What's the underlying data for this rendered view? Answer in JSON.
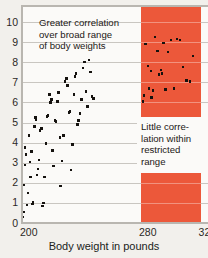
{
  "chart_data": {
    "type": "scatter",
    "title": "",
    "xlabel": "Body weight in pounds",
    "ylabel": "",
    "xlim": [
      200,
      325
    ],
    "ylim": [
      0,
      10.8
    ],
    "grid": true,
    "legend": false,
    "xticks": [
      {
        "value": 200,
        "label": "200"
      },
      {
        "value": 280,
        "label": "280"
      },
      {
        "value": 320,
        "label": "320"
      }
    ],
    "yticks": [
      {
        "value": 0,
        "label": "0"
      },
      {
        "value": 1,
        "label": "1"
      },
      {
        "value": 2,
        "label": "2"
      },
      {
        "value": 3,
        "label": "3"
      },
      {
        "value": 4,
        "label": "4"
      },
      {
        "value": 5,
        "label": "5"
      },
      {
        "value": 6,
        "label": "6"
      },
      {
        "value": 7,
        "label": "7"
      },
      {
        "value": 8,
        "label": "8"
      },
      {
        "value": 9,
        "label": "9"
      },
      {
        "value": 10,
        "label": "10"
      }
    ],
    "highlight_band": {
      "x_start": 280,
      "x_end": 320,
      "color": "#ec583a",
      "label": "restricted range"
    },
    "annotations": [
      {
        "name": "broad-range-note",
        "text": "Greater correlation over broad range of body weights",
        "lines": [
          "Greater correlation",
          "over broad range",
          "of body weights"
        ]
      },
      {
        "name": "restricted-range-note",
        "text": "Little correlation within restricted range",
        "lines": [
          "Little corre-",
          "lation within",
          "restricted",
          "range"
        ]
      }
    ],
    "series": [
      {
        "name": "broad-range-points",
        "color": "#15120f",
        "points": [
          [
            200.6,
            0.3
          ],
          [
            201.4,
            0.55
          ],
          [
            201.0,
            1.9
          ],
          [
            202.2,
            2.9
          ],
          [
            202.6,
            3.4
          ],
          [
            202.0,
            3.75
          ],
          [
            203.2,
            0.9
          ],
          [
            204.0,
            1.5
          ],
          [
            204.6,
            4.35
          ],
          [
            205.2,
            3.05
          ],
          [
            205.8,
            2.3
          ],
          [
            206.4,
            3.55
          ],
          [
            207.0,
            0.95
          ],
          [
            207.6,
            1.05
          ],
          [
            208.4,
            4.8
          ],
          [
            209.0,
            5.25
          ],
          [
            209.6,
            5.15
          ],
          [
            210.2,
            2.4
          ],
          [
            210.8,
            2.7
          ],
          [
            211.6,
            3.15
          ],
          [
            212.2,
            4.6
          ],
          [
            213.0,
            4.7
          ],
          [
            213.8,
            0.85
          ],
          [
            214.4,
            1.0
          ],
          [
            215.2,
            2.3
          ],
          [
            216.0,
            3.95
          ],
          [
            216.8,
            5.3
          ],
          [
            217.6,
            5.35
          ],
          [
            218.6,
            6.4
          ],
          [
            219.2,
            6.0
          ],
          [
            219.8,
            6.15
          ],
          [
            220.4,
            3.6
          ],
          [
            221.2,
            2.85
          ],
          [
            222.0,
            5.1
          ],
          [
            223.0,
            5.05
          ],
          [
            223.8,
            6.05
          ],
          [
            224.6,
            6.5
          ],
          [
            225.4,
            4.25
          ],
          [
            226.0,
            1.85
          ],
          [
            227.0,
            3.1
          ],
          [
            228.0,
            4.35
          ],
          [
            229.0,
            7.05
          ],
          [
            229.8,
            7.2
          ],
          [
            230.6,
            6.85
          ],
          [
            231.4,
            5.5
          ],
          [
            232.2,
            5.55
          ],
          [
            233.0,
            2.65
          ],
          [
            234.0,
            3.9
          ],
          [
            234.8,
            6.4
          ],
          [
            235.6,
            7.3
          ],
          [
            236.4,
            7.45
          ],
          [
            237.2,
            4.9
          ],
          [
            238.0,
            5.1
          ],
          [
            239.0,
            5.45
          ],
          [
            240.0,
            6.15
          ],
          [
            241.0,
            7.7
          ],
          [
            242.0,
            8.0
          ],
          [
            243.0,
            6.55
          ],
          [
            244.0,
            5.8
          ],
          [
            245.0,
            8.1
          ],
          [
            246.0,
            7.5
          ],
          [
            247.0,
            6.3
          ],
          [
            248.0,
            6.2
          ]
        ]
      },
      {
        "name": "restricted-range-points",
        "color": "#15120f",
        "points": [
          [
            281.5,
            6.05
          ],
          [
            282.0,
            6.35
          ],
          [
            283.0,
            8.9
          ],
          [
            284.5,
            7.8
          ],
          [
            285.5,
            6.7
          ],
          [
            286.5,
            7.55
          ],
          [
            288.0,
            6.6
          ],
          [
            289.5,
            9.25
          ],
          [
            291.0,
            8.55
          ],
          [
            292.0,
            7.4
          ],
          [
            293.5,
            7.6
          ],
          [
            295.0,
            8.95
          ],
          [
            296.5,
            6.65
          ],
          [
            298.0,
            8.5
          ],
          [
            300.0,
            9.1
          ],
          [
            302.0,
            6.7
          ],
          [
            304.0,
            9.15
          ],
          [
            306.0,
            9.1
          ],
          [
            308.0,
            7.75
          ],
          [
            310.5,
            7.1
          ],
          [
            313.0,
            7.05
          ],
          [
            315.0,
            8.3
          ],
          [
            294.0,
            7.45
          ],
          [
            287.0,
            6.25
          ]
        ]
      }
    ]
  },
  "axis": {
    "x_title": "Body weight in pounds"
  }
}
